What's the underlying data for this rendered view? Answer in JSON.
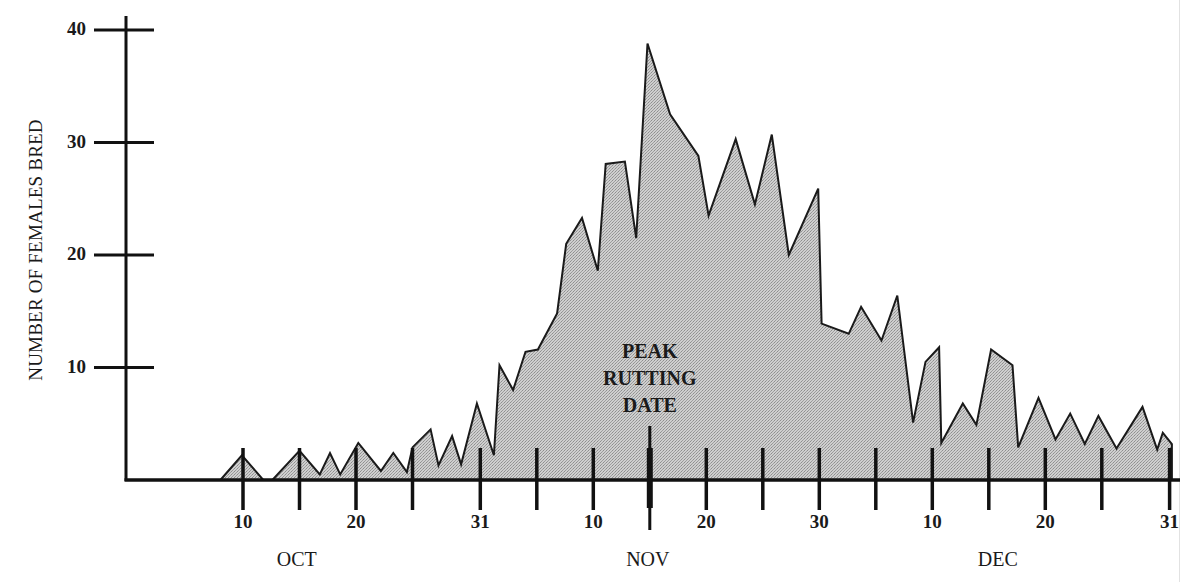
{
  "chart_data": {
    "type": "area",
    "title": "",
    "xlabel": "",
    "ylabel": "NUMBER OF FEMALES BRED",
    "ylim": [
      0,
      40
    ],
    "yticks": [
      10,
      20,
      30,
      40
    ],
    "x_unit": "day of season (1 = Oct 1, 32 = Nov 1, 62 = Dec 1)",
    "xlim": [
      1,
      92
    ],
    "xticks": [
      {
        "day": 10,
        "label": "10"
      },
      {
        "day": 15,
        "label": ""
      },
      {
        "day": 20,
        "label": "20"
      },
      {
        "day": 25,
        "label": ""
      },
      {
        "day": 31,
        "label": "31"
      },
      {
        "day": 36,
        "label": ""
      },
      {
        "day": 41,
        "label": "10"
      },
      {
        "day": 46,
        "label": "",
        "highlight": true
      },
      {
        "day": 51,
        "label": "20"
      },
      {
        "day": 56,
        "label": ""
      },
      {
        "day": 61,
        "label": "30"
      },
      {
        "day": 66,
        "label": ""
      },
      {
        "day": 71,
        "label": "10"
      },
      {
        "day": 76,
        "label": ""
      },
      {
        "day": 81,
        "label": "20"
      },
      {
        "day": 86,
        "label": ""
      },
      {
        "day": 92,
        "label": "31"
      }
    ],
    "months": [
      {
        "label": "OCT",
        "day": 16
      },
      {
        "label": "NOV",
        "day": 46
      },
      {
        "label": "DEC",
        "day": 76
      }
    ],
    "annotation": {
      "lines": [
        "PEAK",
        "RUTTING",
        "DATE"
      ],
      "day": 46
    },
    "grid": false,
    "legend": null,
    "fill_color": "#c4c4c4",
    "line_color": "#1a1a1a",
    "series": [
      {
        "name": "Number of females bred",
        "points": [
          [
            8.0,
            0
          ],
          [
            9.9,
            2.2
          ],
          [
            11.8,
            0
          ],
          [
            12.6,
            0
          ],
          [
            15.0,
            2.6
          ],
          [
            16.8,
            0.5
          ],
          [
            17.7,
            2.4
          ],
          [
            18.6,
            0.5
          ],
          [
            20.2,
            3.3
          ],
          [
            22.2,
            0.8
          ],
          [
            23.3,
            2.4
          ],
          [
            24.5,
            0.7
          ],
          [
            25.0,
            2.9
          ],
          [
            26.6,
            4.5
          ],
          [
            27.3,
            1.3
          ],
          [
            28.5,
            3.9
          ],
          [
            29.3,
            1.4
          ],
          [
            30.7,
            6.8
          ],
          [
            32.2,
            2.2
          ],
          [
            32.7,
            10.2
          ],
          [
            33.9,
            8.0
          ],
          [
            35.0,
            11.4
          ],
          [
            36.1,
            11.6
          ],
          [
            37.8,
            14.8
          ],
          [
            38.6,
            21.0
          ],
          [
            40.0,
            23.3
          ],
          [
            41.4,
            18.6
          ],
          [
            42.1,
            28.1
          ],
          [
            43.8,
            28.3
          ],
          [
            44.8,
            21.5
          ],
          [
            45.8,
            38.8
          ],
          [
            47.8,
            32.5
          ],
          [
            50.3,
            28.8
          ],
          [
            51.2,
            23.5
          ],
          [
            53.6,
            30.3
          ],
          [
            55.3,
            24.5
          ],
          [
            56.8,
            30.7
          ],
          [
            58.3,
            20.0
          ],
          [
            60.9,
            25.9
          ],
          [
            61.2,
            13.9
          ],
          [
            63.6,
            13.0
          ],
          [
            64.7,
            15.4
          ],
          [
            66.5,
            12.4
          ],
          [
            67.9,
            16.4
          ],
          [
            69.3,
            5.1
          ],
          [
            70.4,
            10.5
          ],
          [
            71.6,
            11.8
          ],
          [
            71.8,
            3.3
          ],
          [
            73.7,
            6.8
          ],
          [
            74.9,
            4.9
          ],
          [
            76.2,
            11.6
          ],
          [
            78.1,
            10.2
          ],
          [
            78.6,
            2.9
          ],
          [
            80.4,
            7.3
          ],
          [
            81.9,
            3.6
          ],
          [
            83.2,
            5.9
          ],
          [
            84.5,
            3.2
          ],
          [
            85.7,
            5.7
          ],
          [
            87.3,
            2.8
          ],
          [
            89.6,
            6.5
          ],
          [
            90.9,
            2.7
          ],
          [
            91.4,
            4.2
          ],
          [
            92.2,
            3.2
          ],
          [
            92.2,
            0
          ]
        ]
      }
    ]
  }
}
